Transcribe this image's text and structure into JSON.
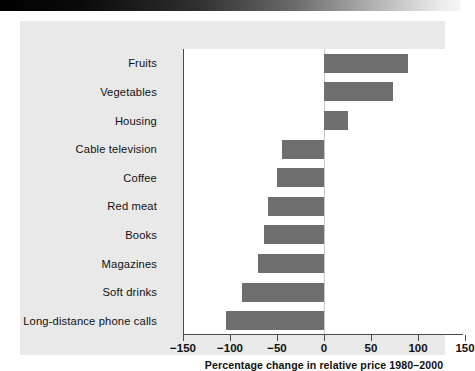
{
  "chart_data": {
    "type": "bar",
    "orientation": "horizontal",
    "title": "",
    "subtitle": "",
    "xlabel": "Percentage change in relative price 1980–2000",
    "ylabel": "",
    "categories": [
      "Fruits",
      "Vegetables",
      "Housing",
      "Cable television",
      "Coffee",
      "Red meat",
      "Books",
      "Magazines",
      "Soft drinks",
      "Long-distance phone calls"
    ],
    "values": [
      89,
      73,
      25,
      -45,
      -50,
      -60,
      -64,
      -70,
      -87,
      -104
    ],
    "xlim": [
      -150,
      150
    ],
    "xticks": [
      -150,
      -100,
      -50,
      0,
      50,
      100,
      150
    ],
    "xtick_labels": [
      "−150",
      "−100",
      "−50",
      "0",
      "50",
      "100",
      "150"
    ],
    "grid": false,
    "legend": null,
    "zero_reference_line": true,
    "series": [
      {
        "name": "Percentage change in relative price 1980–2000",
        "values": [
          89,
          73,
          25,
          -45,
          -50,
          -60,
          -64,
          -70,
          -87,
          -104
        ]
      }
    ]
  },
  "colors": {
    "bar": "#6e6e6e",
    "panel_background": "#e9e9e9",
    "plot_background": "#ffffff",
    "axis": "#4a4a4a",
    "text": "#111111",
    "zero_line": "#c9c9c9"
  },
  "banner": {
    "name": "page-header-band"
  }
}
